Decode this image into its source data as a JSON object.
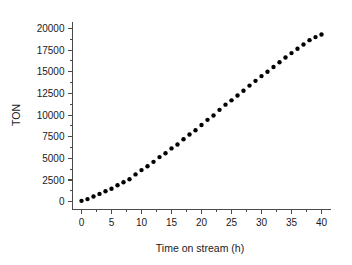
{
  "chart_data": {
    "type": "scatter",
    "title": "",
    "xlabel": "Time on stream (h)",
    "ylabel": "TON",
    "xlim": [
      -1.5,
      41.5
    ],
    "ylim": [
      -900,
      20800
    ],
    "grid": false,
    "legend": null,
    "marker": {
      "shape": "circle",
      "color": "#000000",
      "size_px": 4.4
    },
    "xticks": [
      0,
      5,
      10,
      15,
      20,
      25,
      30,
      35,
      40
    ],
    "xticklabels": [
      "0",
      "5",
      "10",
      "15",
      "20",
      "25",
      "30",
      "35",
      "40"
    ],
    "yticks": [
      0,
      2500,
      5000,
      7500,
      10000,
      12500,
      15000,
      17500,
      20000
    ],
    "yticklabels": [
      "0",
      "2500",
      "5000",
      "7500",
      "10000",
      "12500",
      "15000",
      "17500",
      "20000"
    ],
    "x_minor_tick_interval": 2.5,
    "y_minor_tick_interval": 1250,
    "series": [
      {
        "name": "TON vs time on stream",
        "x": [
          0,
          1,
          2,
          3,
          4,
          5,
          6,
          7,
          8,
          9,
          10,
          11,
          12,
          13,
          14,
          15,
          16,
          17,
          18,
          19,
          20,
          21,
          22,
          23,
          24,
          25,
          26,
          27,
          28,
          29,
          30,
          31,
          32,
          33,
          34,
          35,
          36,
          37,
          38,
          39,
          40
        ],
        "y": [
          100,
          300,
          600,
          900,
          1200,
          1500,
          1900,
          2250,
          2600,
          3150,
          3650,
          4100,
          4600,
          5150,
          5600,
          6150,
          6600,
          7200,
          7750,
          8250,
          8850,
          9450,
          9950,
          10600,
          11200,
          11700,
          12250,
          12800,
          13400,
          13950,
          14500,
          15000,
          15550,
          16100,
          16650,
          17150,
          17650,
          18150,
          18650,
          19000,
          19300
        ]
      }
    ]
  },
  "axes": {
    "y_title": "TON",
    "x_title": "Time on stream (h)"
  }
}
